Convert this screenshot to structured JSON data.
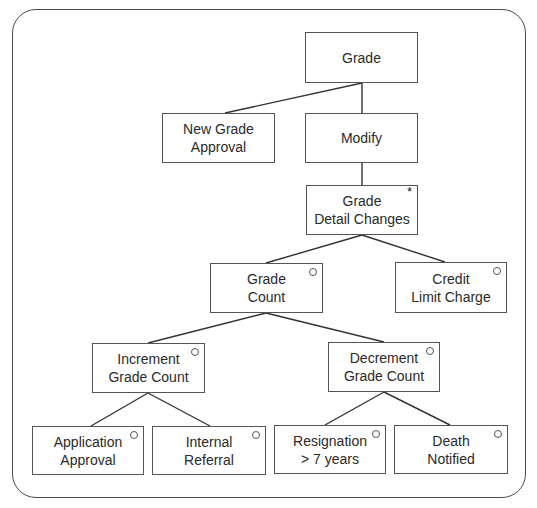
{
  "diagram": {
    "type": "jackson-structure-diagram",
    "nodes": [
      {
        "id": "grade",
        "label": "Grade",
        "marker": "",
        "x": 305,
        "y": 32,
        "w": 113,
        "h": 51
      },
      {
        "id": "new-grade-approval",
        "label": "New Grade\nApproval",
        "marker": "",
        "x": 162,
        "y": 113,
        "w": 113,
        "h": 50
      },
      {
        "id": "modify",
        "label": "Modify",
        "marker": "",
        "x": 305,
        "y": 113,
        "w": 113,
        "h": 50
      },
      {
        "id": "grade-detail-changes",
        "label": "Grade\nDetail Changes",
        "marker": "*",
        "x": 306,
        "y": 185,
        "w": 112,
        "h": 50
      },
      {
        "id": "grade-count",
        "label": "Grade\nCount",
        "marker": "o",
        "x": 210,
        "y": 263,
        "w": 113,
        "h": 50
      },
      {
        "id": "credit-limit-charge",
        "label": "Credit\nLimit Charge",
        "marker": "o",
        "x": 395,
        "y": 262,
        "w": 112,
        "h": 51
      },
      {
        "id": "increment-grade-count",
        "label": "Increment\nGrade Count",
        "marker": "o",
        "x": 92,
        "y": 343,
        "w": 113,
        "h": 50
      },
      {
        "id": "decrement-grade-count",
        "label": "Decrement\nGrade Count",
        "marker": "o",
        "x": 328,
        "y": 342,
        "w": 112,
        "h": 50
      },
      {
        "id": "application-approval",
        "label": "Application\nApproval",
        "marker": "o",
        "x": 32,
        "y": 426,
        "w": 112,
        "h": 49
      },
      {
        "id": "internal-referral",
        "label": "Internal\nReferral",
        "marker": "o",
        "x": 152,
        "y": 426,
        "w": 114,
        "h": 49
      },
      {
        "id": "resignation-7-years",
        "label": "Resignation\n> 7 years",
        "marker": "o",
        "x": 274,
        "y": 425,
        "w": 112,
        "h": 49
      },
      {
        "id": "death-notified",
        "label": "Death\nNotified",
        "marker": "o",
        "x": 394,
        "y": 425,
        "w": 114,
        "h": 49
      }
    ],
    "edges": [
      {
        "from": "grade",
        "to": "new-grade-approval",
        "x1": 362,
        "y1": 83,
        "x2": 225,
        "y2": 113
      },
      {
        "from": "grade",
        "to": "modify",
        "x1": 362,
        "y1": 83,
        "x2": 362,
        "y2": 113
      },
      {
        "from": "modify",
        "to": "grade-detail-changes",
        "x1": 362,
        "y1": 163,
        "x2": 362,
        "y2": 185
      },
      {
        "from": "grade-detail-changes",
        "to": "grade-count",
        "x1": 362,
        "y1": 235,
        "x2": 266,
        "y2": 263
      },
      {
        "from": "grade-detail-changes",
        "to": "credit-limit-charge",
        "x1": 362,
        "y1": 235,
        "x2": 445,
        "y2": 262
      },
      {
        "from": "grade-count",
        "to": "increment-grade-count",
        "x1": 266,
        "y1": 313,
        "x2": 148,
        "y2": 343
      },
      {
        "from": "grade-count",
        "to": "decrement-grade-count",
        "x1": 266,
        "y1": 313,
        "x2": 384,
        "y2": 342
      },
      {
        "from": "increment-grade-count",
        "to": "application-approval",
        "x1": 148,
        "y1": 393,
        "x2": 91,
        "y2": 426
      },
      {
        "from": "increment-grade-count",
        "to": "internal-referral",
        "x1": 148,
        "y1": 393,
        "x2": 210,
        "y2": 426
      },
      {
        "from": "decrement-grade-count",
        "to": "resignation-7-years",
        "x1": 384,
        "y1": 392,
        "x2": 325,
        "y2": 425
      },
      {
        "from": "decrement-grade-count",
        "to": "death-notified",
        "x1": 384,
        "y1": 392,
        "x2": 450,
        "y2": 425
      }
    ],
    "legend_markers": {
      "*": "iteration",
      "o": "selection"
    }
  },
  "colors": {
    "frame": "#4a4a4a",
    "box_border": "#555555",
    "line": "#333333",
    "text": "#2a2a2a",
    "background": "#ffffff"
  }
}
